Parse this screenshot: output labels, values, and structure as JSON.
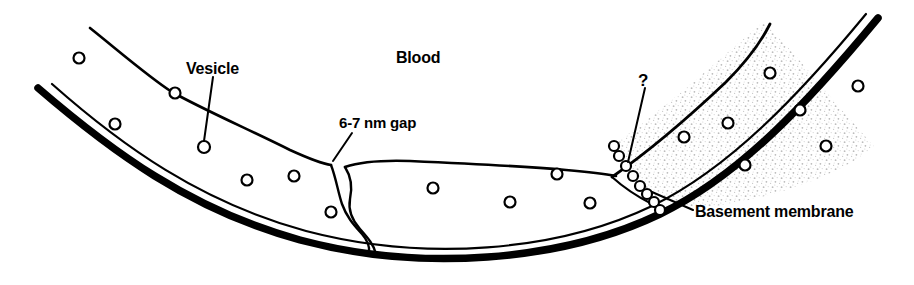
{
  "figure": {
    "type": "biological-diagram",
    "background_color": "#ffffff",
    "ink_color": "#000000",
    "stipple_color": "#cfcfcf"
  },
  "labels": {
    "blood": "Blood",
    "vesicle": "Vesicle",
    "gap": "6-7 nm gap",
    "basement_membrane": "Basement membrane",
    "question": "?"
  },
  "structures": [
    {
      "name": "blood-lumen",
      "label": "Blood",
      "description": "open space above the endothelial layer"
    },
    {
      "name": "endothelial-cell-left",
      "label": "",
      "description": "unshaded endothelial cell forming left and middle wall"
    },
    {
      "name": "endothelial-cell-right",
      "label": "",
      "description": "stippled endothelial cell on the right limb"
    },
    {
      "name": "intercellular-cleft",
      "label": "6-7 nm gap",
      "description": "winding junction between adjacent endothelial cells"
    },
    {
      "name": "basement-membrane",
      "label": "Basement membrane",
      "description": "thick dark line beneath the endothelium"
    },
    {
      "name": "vesicle-chain",
      "label": "?",
      "description": "chain of fused vesicles crossing the right cell"
    }
  ],
  "vesicles": {
    "count": 20,
    "radius": 5.5,
    "positions": [
      [
        79,
        58
      ],
      [
        115,
        124
      ],
      [
        175,
        93
      ],
      [
        204,
        147
      ],
      [
        247,
        180
      ],
      [
        294,
        176
      ],
      [
        331,
        212
      ],
      [
        433,
        188
      ],
      [
        510,
        202
      ],
      [
        557,
        174
      ],
      [
        590,
        203
      ],
      [
        684,
        137
      ],
      [
        728,
        123
      ],
      [
        745,
        165
      ],
      [
        770,
        73
      ],
      [
        800,
        110
      ],
      [
        826,
        146
      ],
      [
        858,
        86
      ]
    ]
  },
  "vesicle_chain": {
    "count": 8,
    "radius": 5.0,
    "positions": [
      [
        614,
        146
      ],
      [
        619,
        156
      ],
      [
        626,
        166
      ],
      [
        633,
        176
      ],
      [
        640,
        186
      ],
      [
        647,
        194
      ],
      [
        654,
        202
      ],
      [
        660,
        210
      ]
    ]
  },
  "leaders": {
    "vesicle": {
      "from": [
        213,
        77
      ],
      "to": [
        204,
        141
      ]
    },
    "gap": {
      "from": [
        352,
        133
      ],
      "to": [
        333,
        161
      ]
    },
    "question": {
      "from": [
        645,
        88
      ],
      "to": [
        628,
        162
      ]
    },
    "basement_membrane": {
      "from": [
        693,
        210
      ],
      "to": [
        652,
        192
      ]
    }
  }
}
